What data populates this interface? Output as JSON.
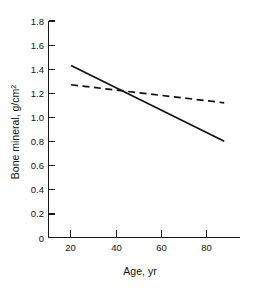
{
  "chart_data": {
    "type": "line",
    "title": "",
    "xlabel": "Age, yr",
    "ylabel": "Bone mineral, g/cm",
    "ylabel_superscript": "2",
    "xlim": [
      10,
      95
    ],
    "ylim": [
      0,
      1.8
    ],
    "grid": false,
    "legend": "none",
    "xticks": [
      20,
      40,
      60,
      80
    ],
    "xtick_labels": [
      "20",
      "40",
      "60",
      "80"
    ],
    "yticks": [
      0,
      0.2,
      0.4,
      0.6,
      0.8,
      1.0,
      1.2,
      1.4,
      1.6,
      1.8
    ],
    "ytick_labels": [
      "0",
      "0.2",
      "0.4",
      "0.6",
      "0.8",
      "1.0",
      "1.2",
      "1.4",
      "1.6",
      "1.8"
    ],
    "series": [
      {
        "name": "solid-regression-line",
        "style": "solid",
        "color": "#111111",
        "x": [
          20,
          88
        ],
        "values": [
          1.43,
          0.8
        ]
      },
      {
        "name": "dashed-regression-line",
        "style": "dashed",
        "color": "#111111",
        "x": [
          20,
          88
        ],
        "values": [
          1.27,
          1.12
        ]
      }
    ],
    "annotations": [
      {
        "name": "line-intersection",
        "x": 44,
        "y": 1.22
      }
    ]
  },
  "colors": {
    "background": "#ffffff",
    "axis": "#1a1a1a",
    "series": "#111111"
  }
}
